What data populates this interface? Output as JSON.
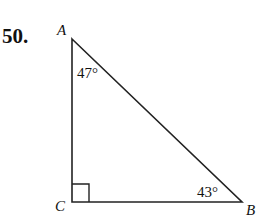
{
  "problem_number": "50.",
  "triangle": {
    "vertices": {
      "A": {
        "label": "A",
        "x": 72,
        "y": 39
      },
      "B": {
        "label": "B",
        "x": 242,
        "y": 202
      },
      "C": {
        "label": "C",
        "x": 72,
        "y": 202
      }
    },
    "angles": {
      "A": "47°",
      "B": "43°",
      "C": "right angle"
    },
    "stroke_color": "#222222"
  }
}
